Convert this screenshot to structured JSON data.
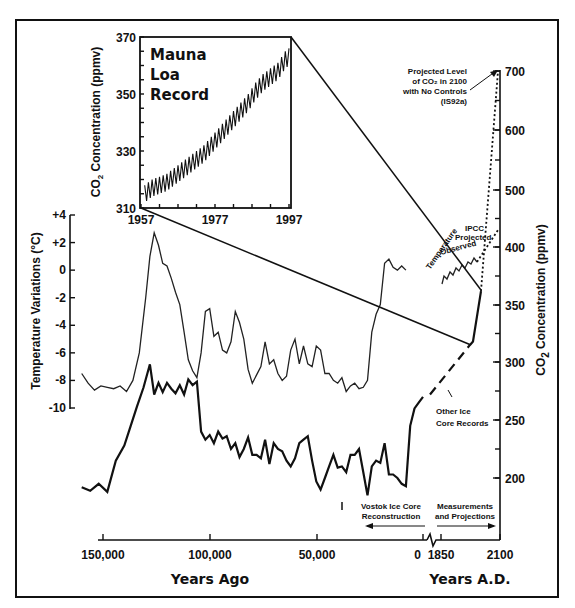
{
  "chart_data": {
    "type": "line",
    "title": "",
    "xlabel_left": "Years Ago",
    "xlabel_right": "Years A.D.",
    "ylabel_left": "Temperature Variations (°C)",
    "ylabel_right": "CO2 Concentration (ppmv)",
    "x_ticks": [
      "150,000",
      "100,000",
      "50,000",
      "0",
      "1850",
      "2100"
    ],
    "y_left_ticks": [
      "+4",
      "+2",
      "0",
      "-2",
      "-4",
      "-6",
      "-8",
      "-10"
    ],
    "y_left_range": [
      -10,
      4
    ],
    "y_right_ticks": [
      "700",
      "600",
      "500",
      "400",
      "350",
      "300",
      "250",
      "200"
    ],
    "series": [
      {
        "name": "Temperature (Vostok)",
        "x_years_ago": [
          160000,
          157000,
          154000,
          151000,
          148000,
          145000,
          142000,
          139000,
          136000,
          133000,
          130000,
          128000,
          126000,
          124000,
          122000,
          120000,
          118000,
          116000,
          114000,
          112000,
          110000,
          108000,
          106000,
          104000,
          102000,
          100000,
          98000,
          96000,
          94000,
          92000,
          90000,
          88000,
          86000,
          84000,
          82000,
          80000,
          78000,
          76000,
          74000,
          72000,
          70000,
          68000,
          66000,
          64000,
          62000,
          60000,
          58000,
          56000,
          54000,
          52000,
          50000,
          48000,
          46000,
          44000,
          42000,
          40000,
          38000,
          36000,
          34000,
          32000,
          30000,
          28000,
          26000,
          24000,
          22000,
          20000,
          18000,
          16000,
          14000,
          12000,
          10000,
          8000,
          6000,
          4000,
          2000,
          0
        ],
        "values": [
          -7.5,
          -8.2,
          -8.7,
          -8.4,
          -8.5,
          -8.6,
          -8.4,
          -8.8,
          -8.0,
          -6.0,
          -2.0,
          1.0,
          2.7,
          1.8,
          0.5,
          0.3,
          -0.6,
          -1.6,
          -2.5,
          -4.5,
          -6.5,
          -7.3,
          -7.8,
          -6.0,
          -3.0,
          -2.8,
          -4.8,
          -4.5,
          -5.8,
          -6.0,
          -5.2,
          -3.0,
          -3.8,
          -5.0,
          -7.2,
          -8.2,
          -7.6,
          -7.0,
          -5.2,
          -6.8,
          -6.5,
          -7.5,
          -8.0,
          -7.7,
          -5.8,
          -5.0,
          -6.8,
          -5.5,
          -6.8,
          -7.0,
          -5.5,
          -5.8,
          -7.5,
          -7.5,
          -8.0,
          -8.2,
          -7.8,
          -8.8,
          -8.4,
          -8.2,
          -8.6,
          -8.5,
          -8.0,
          -4.5,
          -3.2,
          -2.5,
          0.5,
          0.8,
          0.2,
          0.0,
          0.3,
          0.0
        ],
        "axis": "left"
      },
      {
        "name": "CO2 (Vostok Ice Core Reconstruction)",
        "x_years_ago": [
          160000,
          156000,
          152000,
          148000,
          144000,
          140000,
          137000,
          134000,
          131000,
          128000,
          126000,
          124000,
          122000,
          120000,
          118000,
          116000,
          114000,
          112000,
          110000,
          108000,
          106000,
          104000,
          102000,
          100000,
          98000,
          96000,
          94000,
          92000,
          90000,
          88000,
          86000,
          84000,
          82000,
          80000,
          78000,
          76000,
          74000,
          72000,
          70000,
          68000,
          66000,
          64000,
          62000,
          60000,
          58000,
          56000,
          54000,
          52000,
          50000,
          48000,
          46000,
          44000,
          42000,
          40000,
          38000,
          36000,
          34000,
          32000,
          30000,
          28000,
          26000,
          24000,
          22000,
          20000,
          18000,
          16000,
          14000,
          12000,
          10000,
          8000,
          6000,
          4000,
          2000,
          0
        ],
        "values": [
          192,
          189,
          195,
          188,
          215,
          228,
          245,
          262,
          278,
          298,
          272,
          282,
          274,
          282,
          277,
          273,
          280,
          272,
          285,
          280,
          283,
          240,
          233,
          237,
          230,
          240,
          234,
          236,
          225,
          230,
          218,
          225,
          235,
          220,
          220,
          217,
          233,
          212,
          230,
          225,
          223,
          215,
          210,
          217,
          230,
          233,
          236,
          215,
          197,
          190,
          200,
          210,
          220,
          209,
          210,
          205,
          220,
          220,
          225,
          205,
          185,
          210,
          215,
          213,
          230,
          203,
          203,
          200,
          195,
          193,
          245,
          260,
          265,
          270
        ],
        "axis": "right"
      },
      {
        "name": "CO2 Other Ice Core Records",
        "x_years_AD": [
          0,
          1850
        ],
        "values": [
          272,
          315
        ],
        "axis": "right"
      },
      {
        "name": "CO2 Measurements (Mauna Loa era)",
        "x_years_AD": [
          1850,
          1997
        ],
        "values": [
          315,
          362
        ],
        "axis": "right"
      },
      {
        "name": "Projected CO2 with No Controls (IS92a)",
        "x_years_AD": [
          1997,
          2100
        ],
        "values": [
          362,
          700
        ],
        "axis": "right"
      },
      {
        "name": "IPCC Projected Temperature",
        "x_years_AD": [
          1997,
          2100
        ],
        "values": [
          0.5,
          2.5
        ],
        "axis": "left"
      }
    ],
    "inset": {
      "title": [
        "Mauna",
        "Loa",
        "Record"
      ],
      "ylabel": "CO2 Concentration (ppmv)",
      "x_ticks": [
        "1957",
        "1977",
        "1997"
      ],
      "y_ticks": [
        "370",
        "350",
        "330",
        "310"
      ],
      "ylim": [
        310,
        370
      ],
      "xlim": [
        1957,
        1997
      ],
      "x": [
        1958,
        1960,
        1962,
        1964,
        1966,
        1968,
        1970,
        1972,
        1974,
        1976,
        1978,
        1980,
        1982,
        1984,
        1986,
        1988,
        1990,
        1992,
        1994,
        1996,
        1997
      ],
      "values": [
        315,
        317,
        318,
        319,
        321,
        323,
        325,
        327,
        329,
        332,
        335,
        338,
        341,
        344,
        347,
        351,
        354,
        356,
        358,
        362,
        363
      ],
      "seasonal_amplitude_ppmv": 3
    },
    "annotations": [
      "Projected Level of CO2 in 2100 with No Controls (IS92a)",
      "Temperature Observed",
      "IPCC Projected",
      "Other Ice Core Records",
      "Vostok Ice Core Reconstruction",
      "Measurements and Projections"
    ],
    "grid": false,
    "legend": "none"
  },
  "labels": {
    "y_left_title": "Temperature Variations (°C)",
    "y_right_title_main": "CO",
    "y_right_title_sub": "2",
    "y_right_title_rest": " Concentration (ppmv)",
    "x_left_title": "Years Ago",
    "x_right_title": "Years A.D.",
    "inset_ylabel_main": "CO",
    "inset_ylabel_sub": "2",
    "inset_ylabel_rest": " Concentration (ppmv)",
    "inset_title_1": "Mauna",
    "inset_title_2": "Loa",
    "inset_title_3": "Record",
    "ann_projected_1": "Projected Level",
    "ann_projected_2": "of CO₂ in 2100",
    "ann_projected_3": "with No Controls",
    "ann_projected_4": "(IS92a)",
    "ann_temperature": "Temperature",
    "ann_observed": "Observed",
    "ann_ipcc": "IPCC",
    "ann_ipcc_projected": "Projected",
    "ann_other_1": "Other Ice",
    "ann_other_2": "Core Records",
    "ann_vostok_1": "Vostok Ice Core",
    "ann_vostok_2": "Reconstruction",
    "ann_meas_1": "Measurements",
    "ann_meas_2": "and Projections"
  }
}
